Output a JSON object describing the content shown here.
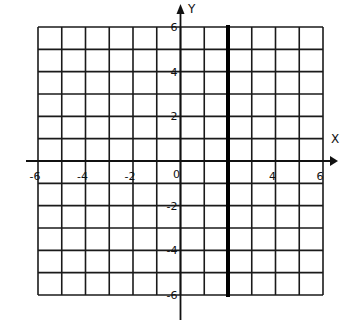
{
  "chart_data": {
    "type": "line",
    "title": "",
    "xlabel": "X",
    "ylabel": "Y",
    "xlim": [
      -6,
      6
    ],
    "ylim": [
      -6,
      6
    ],
    "grid": true,
    "grid_step": 1,
    "x_tick_labels": [
      "-6",
      "-4",
      "-2",
      "0",
      "4",
      "6"
    ],
    "x_tick_values": [
      -6,
      -4,
      -2,
      0,
      4,
      6
    ],
    "y_tick_labels": [
      "6",
      "4",
      "2",
      "-2",
      "-4",
      "-6"
    ],
    "y_tick_values": [
      6,
      4,
      2,
      -2,
      -4,
      -6
    ],
    "origin_label": "0",
    "series": [
      {
        "name": "vertical line x = 2",
        "equation": "x = 2",
        "x": [
          2,
          2
        ],
        "y": [
          -6,
          6
        ],
        "style": "thick-solid"
      }
    ],
    "legend": null
  },
  "colors": {
    "grid": "#1a1a1a",
    "axis": "#111111",
    "line": "#000000",
    "background": "#ffffff"
  }
}
